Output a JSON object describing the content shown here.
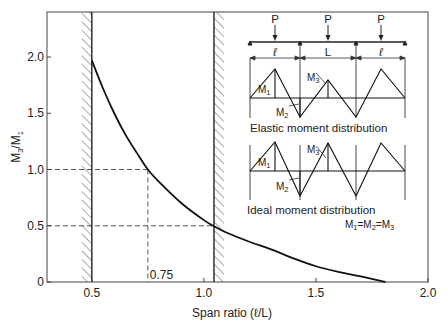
{
  "chart_data": {
    "type": "line",
    "title": "",
    "xlabel": "Span ratio (ℓ/L)",
    "ylabel": "M3/M1",
    "xlim": [
      0.3,
      2.0
    ],
    "ylim": [
      0,
      2.4
    ],
    "x_ticks": [
      0.5,
      1.0,
      1.5,
      2.0
    ],
    "x_tick_labels": [
      "0.5",
      "1.0",
      "1.5",
      "2.0"
    ],
    "y_ticks": [
      0,
      0.5,
      1.0,
      1.5,
      2.0
    ],
    "y_tick_labels": [
      "0",
      "0.5",
      "1.0",
      "1.5",
      "2.0"
    ],
    "grid": false,
    "series": [
      {
        "name": "M3/M1 vs span ratio",
        "x": [
          0.5,
          0.55,
          0.6,
          0.65,
          0.7,
          0.75,
          0.8,
          0.9,
          1.0,
          1.05,
          1.1,
          1.2,
          1.3,
          1.4,
          1.5,
          1.6,
          1.7,
          1.81
        ],
        "y": [
          1.97,
          1.72,
          1.5,
          1.31,
          1.15,
          1.0,
          0.89,
          0.7,
          0.55,
          0.49,
          0.44,
          0.36,
          0.29,
          0.21,
          0.14,
          0.09,
          0.05,
          0.0
        ]
      }
    ],
    "limit_lines": [
      {
        "x": 0.5,
        "hatch_side": "left"
      },
      {
        "x": 1.045,
        "hatch_side": "right"
      }
    ],
    "reference_lines": [
      {
        "type": "horizontal",
        "y": 1.0,
        "x_to": 0.75
      },
      {
        "type": "horizontal",
        "y": 0.5,
        "x_to": 1.045
      },
      {
        "type": "vertical",
        "x": 0.75,
        "y_to": 1.0
      }
    ],
    "annotations": [
      {
        "text": "0.75",
        "x": 0.75,
        "y": 0
      }
    ],
    "inset": {
      "load_label": "P",
      "span_labels": [
        "ℓ",
        "L",
        "ℓ"
      ],
      "diagrams": [
        {
          "caption": "Elastic moment distribution",
          "labels": [
            "M1",
            "M2",
            "M3"
          ]
        },
        {
          "caption": "Ideal moment distribution",
          "labels": [
            "M1",
            "M2",
            "M3"
          ],
          "note": "M1=M2=M3"
        }
      ]
    }
  }
}
